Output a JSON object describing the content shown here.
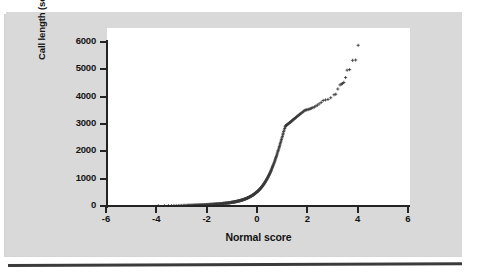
{
  "figure": {
    "background_color": "#ffffff",
    "panel_color": "#d9d9d9",
    "rule_color": "#3b3b3b",
    "marker_color": "#3a3a3a",
    "marker_symbol": "+"
  },
  "chart_data": {
    "type": "scatter",
    "title": "",
    "subtitle": "",
    "xlabel": "Normal score",
    "ylabel": "Call length (seconds)",
    "xlim": [
      -6,
      6
    ],
    "ylim": [
      0,
      6000
    ],
    "xticks": [
      -6,
      -4,
      -2,
      0,
      2,
      4,
      6
    ],
    "xtick_labels": [
      "-6",
      "-4",
      "-2",
      "0",
      "2",
      "4",
      "6"
    ],
    "yticks": [
      0,
      1000,
      2000,
      3000,
      4000,
      5000,
      6000
    ],
    "ytick_labels": [
      "0",
      "1000",
      "2000",
      "3000",
      "4000",
      "5000",
      "6000"
    ],
    "grid": false,
    "legend": null,
    "annotations": [],
    "series": [
      {
        "name": "Call length normal probability plot",
        "marker": "+",
        "color": "#3a3a3a",
        "x": [
          -3.92,
          -3.68,
          -3.52,
          -3.4,
          -3.3,
          -3.21,
          -3.13,
          -3.06,
          -2.99,
          -2.93,
          -2.87,
          -2.82,
          -2.77,
          -2.72,
          -2.68,
          -2.63,
          -2.59,
          -2.55,
          -2.51,
          -2.48,
          -2.44,
          -2.41,
          -2.37,
          -2.34,
          -2.31,
          -2.28,
          -2.25,
          -2.22,
          -2.19,
          -2.16,
          -2.14,
          -2.11,
          -2.08,
          -2.06,
          -2.03,
          -2.01,
          -1.98,
          -1.96,
          -1.94,
          -1.91,
          -1.89,
          -1.87,
          -1.85,
          -1.83,
          -1.8,
          -1.78,
          -1.76,
          -1.74,
          -1.72,
          -1.7,
          -1.68,
          -1.66,
          -1.64,
          -1.62,
          -1.61,
          -1.59,
          -1.57,
          -1.55,
          -1.53,
          -1.51,
          -1.5,
          -1.48,
          -1.46,
          -1.44,
          -1.43,
          -1.41,
          -1.39,
          -1.38,
          -1.36,
          -1.34,
          -1.33,
          -1.31,
          -1.3,
          -1.28,
          -1.26,
          -1.25,
          -1.23,
          -1.22,
          -1.2,
          -1.19,
          -1.17,
          -1.16,
          -1.14,
          -1.13,
          -1.11,
          -1.1,
          -1.08,
          -1.07,
          -1.06,
          -1.04,
          -1.03,
          -1.01,
          -1.0,
          -0.99,
          -0.97,
          -0.96,
          -0.94,
          -0.93,
          -0.92,
          -0.9,
          -0.89,
          -0.88,
          -0.86,
          -0.85,
          -0.84,
          -0.82,
          -0.81,
          -0.8,
          -0.79,
          -0.77,
          -0.76,
          -0.75,
          -0.73,
          -0.72,
          -0.71,
          -0.7,
          -0.68,
          -0.67,
          -0.66,
          -0.65,
          -0.63,
          -0.62,
          -0.61,
          -0.6,
          -0.58,
          -0.57,
          -0.56,
          -0.55,
          -0.54,
          -0.52,
          -0.51,
          -0.5,
          -0.49,
          -0.48,
          -0.46,
          -0.45,
          -0.44,
          -0.43,
          -0.42,
          -0.4,
          -0.39,
          -0.38,
          -0.37,
          -0.36,
          -0.35,
          -0.33,
          -0.32,
          -0.31,
          -0.3,
          -0.29,
          -0.28,
          -0.26,
          -0.25,
          -0.24,
          -0.23,
          -0.22,
          -0.21,
          -0.2,
          -0.18,
          -0.17,
          -0.16,
          -0.15,
          -0.14,
          -0.13,
          -0.12,
          -0.1,
          -0.09,
          -0.08,
          -0.07,
          -0.06,
          -0.05,
          -0.04,
          -0.03,
          -0.01,
          0.0,
          0.01,
          0.03,
          0.04,
          0.05,
          0.06,
          0.07,
          0.08,
          0.1,
          0.11,
          0.12,
          0.13,
          0.14,
          0.15,
          0.16,
          0.18,
          0.19,
          0.2,
          0.21,
          0.22,
          0.23,
          0.25,
          0.26,
          0.27,
          0.28,
          0.29,
          0.31,
          0.32,
          0.33,
          0.34,
          0.35,
          0.37,
          0.38,
          0.39,
          0.4,
          0.42,
          0.43,
          0.44,
          0.45,
          0.47,
          0.48,
          0.49,
          0.51,
          0.52,
          0.53,
          0.55,
          0.56,
          0.57,
          0.58,
          0.6,
          0.61,
          0.62,
          0.64,
          0.65,
          0.67,
          0.68,
          0.7,
          0.71,
          0.72,
          0.74,
          0.75,
          0.77,
          0.78,
          0.8,
          0.81,
          0.83,
          0.84,
          0.86,
          0.88,
          0.89,
          0.91,
          0.92,
          0.94,
          0.96,
          0.97,
          0.99,
          1.01,
          1.03,
          1.04,
          1.06,
          1.08,
          1.1,
          1.12,
          1.13,
          1.15,
          1.17,
          1.19,
          1.21,
          1.23,
          1.25,
          1.28,
          1.3,
          1.32,
          1.34,
          1.37,
          1.39,
          1.41,
          1.44,
          1.46,
          1.49,
          1.52,
          1.54,
          1.57,
          1.6,
          1.63,
          1.66,
          1.69,
          1.72,
          1.76,
          1.79,
          1.83,
          1.86,
          1.9,
          1.94,
          1.98,
          2.03,
          2.07,
          2.12,
          2.17,
          2.22,
          2.28,
          2.34,
          2.4,
          2.47,
          2.55,
          2.63,
          2.72,
          2.82,
          2.93,
          3.06,
          3.13,
          3.21,
          3.3,
          3.35,
          3.4,
          3.45,
          3.52,
          3.58,
          3.68,
          3.8,
          3.92,
          4.02
        ],
        "y": [
          8,
          10,
          12,
          14,
          15,
          17,
          18,
          20,
          21,
          22,
          24,
          25,
          26,
          27,
          28,
          30,
          31,
          32,
          33,
          34,
          35,
          36,
          37,
          38,
          39,
          40,
          41,
          42,
          43,
          44,
          45,
          46,
          47,
          48,
          49,
          50,
          52,
          53,
          54,
          55,
          56,
          57,
          58,
          59,
          60,
          61,
          62,
          63,
          64,
          66,
          67,
          68,
          69,
          70,
          71,
          73,
          74,
          75,
          76,
          78,
          79,
          80,
          82,
          83,
          84,
          86,
          87,
          89,
          90,
          92,
          93,
          95,
          96,
          98,
          99,
          101,
          103,
          104,
          106,
          108,
          110,
          111,
          113,
          115,
          117,
          119,
          121,
          123,
          125,
          127,
          129,
          131,
          133,
          135,
          137,
          139,
          142,
          144,
          146,
          149,
          151,
          153,
          156,
          158,
          161,
          163,
          166,
          169,
          171,
          174,
          177,
          180,
          183,
          186,
          189,
          192,
          195,
          198,
          201,
          204,
          208,
          211,
          214,
          218,
          221,
          225,
          229,
          232,
          236,
          240,
          244,
          248,
          252,
          256,
          260,
          265,
          269,
          273,
          278,
          283,
          287,
          292,
          297,
          302,
          307,
          312,
          317,
          323,
          328,
          334,
          339,
          345,
          351,
          357,
          363,
          370,
          376,
          383,
          389,
          396,
          403,
          410,
          417,
          425,
          432,
          440,
          448,
          456,
          464,
          472,
          481,
          489,
          498,
          507,
          517,
          526,
          536,
          546,
          556,
          566,
          577,
          588,
          599,
          610,
          622,
          634,
          646,
          658,
          671,
          684,
          697,
          711,
          725,
          739,
          754,
          769,
          784,
          800,
          816,
          833,
          850,
          867,
          885,
          903,
          922,
          941,
          961,
          981,
          1002,
          1023,
          1045,
          1067,
          1090,
          1113,
          1137,
          1162,
          1187,
          1213,
          1239,
          1267,
          1295,
          1323,
          1353,
          1383,
          1414,
          1446,
          1479,
          1512,
          1547,
          1582,
          1618,
          1655,
          1693,
          1732,
          1772,
          1813,
          1855,
          1898,
          1942,
          1987,
          2033,
          2080,
          2128,
          2177,
          2227,
          2278,
          2330,
          2383,
          2437,
          2492,
          2548,
          2605,
          2662,
          2720,
          2778,
          2836,
          2894,
          2920,
          2940,
          2958,
          2972,
          2986,
          3000,
          3015,
          3030,
          3048,
          3065,
          3082,
          3100,
          3118,
          3137,
          3156,
          3176,
          3196,
          3216,
          3237,
          3258,
          3280,
          3302,
          3325,
          3348,
          3372,
          3396,
          3421,
          3446,
          3472,
          3498,
          3510,
          3520,
          3530,
          3545,
          3560,
          3578,
          3600,
          3625,
          3655,
          3690,
          3735,
          3790,
          3860,
          3880,
          3900,
          3960,
          4070,
          4090,
          4280,
          4430,
          4460,
          4480,
          4520,
          4700,
          4970,
          4990,
          5330,
          5340,
          5880
        ]
      }
    ]
  }
}
